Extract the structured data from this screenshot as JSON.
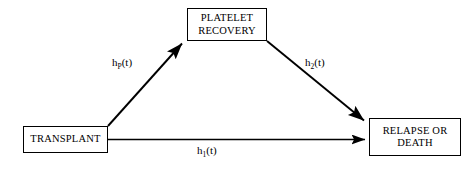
{
  "diagram": {
    "type": "multistate-transition-diagram",
    "nodes": [
      {
        "id": "transplant",
        "label": "TRANSPLANT"
      },
      {
        "id": "platelet",
        "label": "PLATELET\nRECOVERY"
      },
      {
        "id": "relapse",
        "label": "RELAPSE OR\nDEATH"
      }
    ],
    "edges": [
      {
        "id": "transplant-to-platelet",
        "from": "TRANSPLANT",
        "to": "PLATELET RECOVERY",
        "label_base": "h",
        "label_sub": "P",
        "label_tail": "(t)",
        "label_text": "hP(t)"
      },
      {
        "id": "platelet-to-relapse",
        "from": "PLATELET RECOVERY",
        "to": "RELAPSE OR DEATH",
        "label_base": "h",
        "label_sub": "2",
        "label_tail": "(t)",
        "label_text": "h2(t)"
      },
      {
        "id": "transplant-to-relapse",
        "from": "TRANSPLANT",
        "to": "RELAPSE OR DEATH",
        "label_base": "h",
        "label_sub": "1",
        "label_tail": "(t)",
        "label_text": "h1(t)"
      }
    ],
    "colors": {
      "stroke": "#000000",
      "background": "#ffffff",
      "text": "#000000"
    }
  }
}
